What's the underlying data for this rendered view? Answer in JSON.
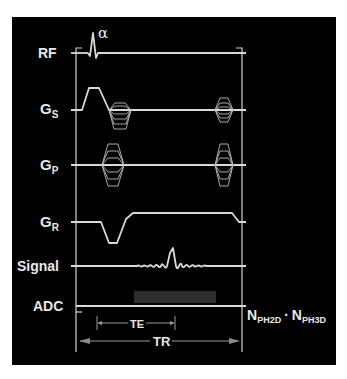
{
  "diagram": {
    "title": "",
    "background_color": "#000000",
    "line_color": "#d9d9d9",
    "rows": [
      {
        "id": "rf",
        "label": "RF",
        "sub": ""
      },
      {
        "id": "gs",
        "label": "G",
        "sub": "S"
      },
      {
        "id": "gp",
        "label": "G",
        "sub": "P"
      },
      {
        "id": "gr",
        "label": "G",
        "sub": "R"
      },
      {
        "id": "signal",
        "label": "Signal",
        "sub": ""
      },
      {
        "id": "adc",
        "label": "ADC",
        "sub": ""
      }
    ],
    "flip_angle_label": "α",
    "intervals": {
      "te_label": "TE",
      "tr_label": "TR"
    },
    "repetition": {
      "n1": "N",
      "n1_sub": "PH2D",
      "dot": "·",
      "n2": "N",
      "n2_sub": "PH3D"
    }
  }
}
